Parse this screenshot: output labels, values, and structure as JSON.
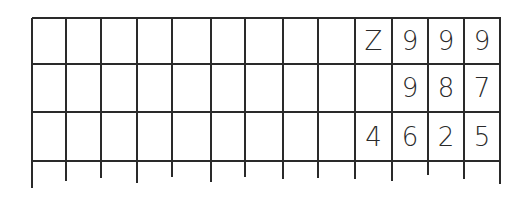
{
  "grid": {
    "columns": 13,
    "rows": 3,
    "line_color": "#2a2a2a",
    "col_x": [
      32,
      66,
      101,
      137,
      172,
      211,
      245,
      283,
      318,
      355,
      392,
      428,
      464,
      500
    ],
    "row_y": [
      18,
      64,
      112,
      161
    ],
    "tick_bottom": [
      188,
      181,
      178,
      183,
      177,
      182,
      177,
      179,
      178,
      179,
      181,
      175,
      179,
      184
    ]
  },
  "cells": [
    {
      "row": 0,
      "col": 9,
      "value": "Z"
    },
    {
      "row": 0,
      "col": 10,
      "value": "9"
    },
    {
      "row": 0,
      "col": 11,
      "value": "9"
    },
    {
      "row": 0,
      "col": 12,
      "value": "9"
    },
    {
      "row": 1,
      "col": 10,
      "value": "9"
    },
    {
      "row": 1,
      "col": 11,
      "value": "8"
    },
    {
      "row": 1,
      "col": 12,
      "value": "7"
    },
    {
      "row": 2,
      "col": 9,
      "value": "4"
    },
    {
      "row": 2,
      "col": 10,
      "value": "6"
    },
    {
      "row": 2,
      "col": 11,
      "value": "2"
    },
    {
      "row": 2,
      "col": 12,
      "value": "5"
    }
  ]
}
